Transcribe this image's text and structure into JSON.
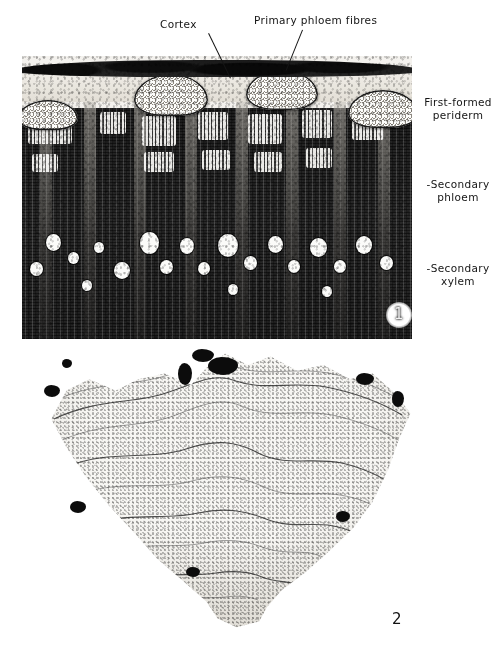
{
  "plate": {
    "title": "Plant stem anatomy micrograph plate",
    "background_color": "#ffffff",
    "ink_color": "#141414"
  },
  "figure1": {
    "number": "1",
    "caption_position": "inside-lower-right",
    "description": "Transverse section of stem showing outer tissues",
    "labels": {
      "cortex": "Cortex",
      "primary_phloem_fibres": "Primary phloem fibres",
      "first_formed_periderm_line1": "First-formed",
      "first_formed_periderm_line2": "periderm",
      "secondary_phloem_line1": "-Secondary",
      "secondary_phloem_line2": "phloem",
      "secondary_xylem_line1": "-Secondary",
      "secondary_xylem_line2": "xylem"
    }
  },
  "figure2": {
    "number": "2",
    "description": "Whole organ cross-section with concentric wavy growth increments"
  }
}
